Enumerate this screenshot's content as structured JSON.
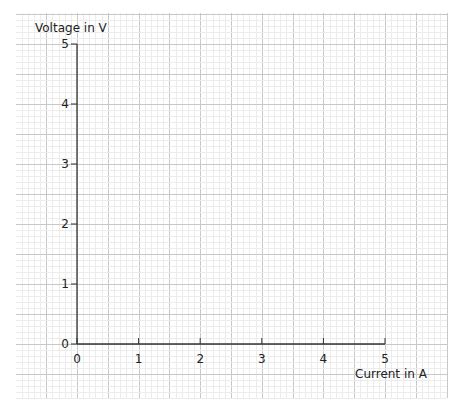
{
  "chart_data": {
    "type": "line",
    "title": "",
    "xlabel": "Current in A",
    "ylabel": "Voltage in V",
    "xlim": [
      0,
      5
    ],
    "ylim": [
      0,
      5
    ],
    "x_ticks": [
      "0",
      "1",
      "2",
      "3",
      "4",
      "5"
    ],
    "y_ticks": [
      "0",
      "1",
      "2",
      "3",
      "4",
      "5"
    ],
    "grid": true,
    "grid_style": "graph paper: minor 0.1 unit, major 0.5 unit",
    "series": []
  },
  "colors": {
    "minor_grid": "#ececec",
    "major_grid": "#c8c8c8",
    "axis": "#333333",
    "text": "#222222"
  }
}
